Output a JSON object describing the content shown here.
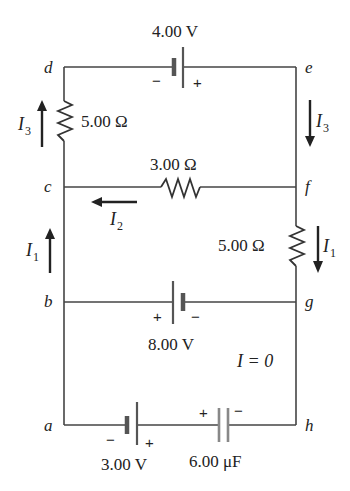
{
  "nodes": {
    "a": "a",
    "b": "b",
    "c": "c",
    "d": "d",
    "e": "e",
    "f": "f",
    "g": "g",
    "h": "h"
  },
  "components": {
    "battery_top": {
      "label": "4.00 V",
      "neg": "−",
      "pos": "+"
    },
    "battery_middle": {
      "label": "8.00 V",
      "neg": "−",
      "pos": "+"
    },
    "battery_bottom": {
      "label": "3.00 V",
      "neg": "−",
      "pos": "+"
    },
    "capacitor": {
      "label": "6.00 μF",
      "pos": "+",
      "neg": "−"
    },
    "resistor_left": {
      "label": "5.00 Ω"
    },
    "resistor_middle": {
      "label": "3.00 Ω"
    },
    "resistor_right": {
      "label": "5.00 Ω"
    }
  },
  "currents": {
    "I3_left": {
      "symbol": "I",
      "sub": "3"
    },
    "I3_right": {
      "symbol": "I",
      "sub": "3"
    },
    "I2": {
      "symbol": "I",
      "sub": "2"
    },
    "I1_left": {
      "symbol": "I",
      "sub": "1"
    },
    "I1_right": {
      "symbol": "I",
      "sub": "1"
    },
    "zero_current": "I = 0"
  }
}
